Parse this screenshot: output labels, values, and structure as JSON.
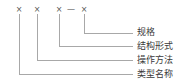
{
  "diagram": {
    "background_color": "#ffffff",
    "line_color": "#a8a8a8",
    "text_color": "#3a3a3a",
    "code_color": "#555555",
    "code": {
      "marks": [
        {
          "symbol": "×",
          "x": 19
        },
        {
          "symbol": "×",
          "x": 37
        },
        {
          "symbol": "×",
          "x": 59
        },
        {
          "symbol": "×",
          "x": 84
        }
      ],
      "separator": {
        "symbol": "—",
        "x": 71
      },
      "full_string": "× ×  × — ×"
    },
    "leaders": [
      {
        "label": "规格",
        "label_x": 137,
        "label_y": 28,
        "stem_x": 84,
        "stem_top": 14,
        "corner_y": 33,
        "line_end_x": 133
      },
      {
        "label": "结构形式",
        "label_x": 137,
        "label_y": 42,
        "stem_x": 59,
        "stem_top": 14,
        "corner_y": 46,
        "line_end_x": 133
      },
      {
        "label": "操作方法",
        "label_x": 137,
        "label_y": 56,
        "stem_x": 37,
        "stem_top": 14,
        "corner_y": 60,
        "line_end_x": 133
      },
      {
        "label": "类型名称",
        "label_x": 137,
        "label_y": 70,
        "stem_x": 19,
        "stem_top": 14,
        "corner_y": 74,
        "line_end_x": 133
      }
    ]
  }
}
